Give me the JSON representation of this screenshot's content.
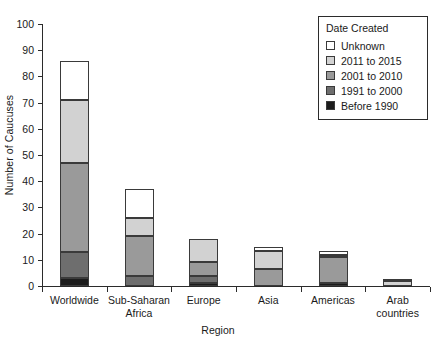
{
  "chart_data": {
    "type": "bar",
    "subtype": "stacked-bar",
    "title": "",
    "xlabel": "Region",
    "ylabel": "Number of Caucuses",
    "ylim": [
      0,
      100
    ],
    "yticks": [
      0,
      10,
      20,
      30,
      40,
      50,
      60,
      70,
      80,
      90,
      100
    ],
    "grid": false,
    "legend_position": "top-right",
    "legend_title": "Date Created",
    "categories": [
      "Worldwide",
      "Sub-Saharan\nAfrica",
      "Europe",
      "Asia",
      "Americas",
      "Arab\ncountries"
    ],
    "series": [
      {
        "name": "Before 1990",
        "color": "#1c1c1c",
        "values": [
          3,
          0,
          1,
          0,
          1,
          0
        ]
      },
      {
        "name": "1991 to 2000",
        "color": "#6e6e6e",
        "values": [
          10,
          4,
          3,
          0,
          0,
          0
        ]
      },
      {
        "name": "2001 to 2010",
        "color": "#9a9a9a",
        "values": [
          34,
          15,
          5,
          6.5,
          10,
          0
        ]
      },
      {
        "name": "2011 to 2015",
        "color": "#d2d2d2",
        "values": [
          24,
          7,
          9,
          7,
          1,
          2
        ]
      },
      {
        "name": "Unknown",
        "color": "#ffffff",
        "values": [
          15,
          11,
          0,
          1.5,
          1.5,
          0.5
        ]
      }
    ],
    "totals": [
      86,
      37,
      18,
      15,
      13.5,
      2.5
    ]
  },
  "legend": {
    "title": "Date Created",
    "items": [
      {
        "label": "Unknown",
        "color": "#ffffff"
      },
      {
        "label": "2011 to 2015",
        "color": "#d2d2d2"
      },
      {
        "label": "2001 to 2010",
        "color": "#9a9a9a"
      },
      {
        "label": "1991 to 2000",
        "color": "#6e6e6e"
      },
      {
        "label": "Before 1990",
        "color": "#1c1c1c"
      }
    ]
  },
  "axes": {
    "y_title": "Number of Caucuses",
    "x_title": "Region",
    "y_tick_labels": [
      "0",
      "10",
      "20",
      "30",
      "40",
      "50",
      "60",
      "70",
      "80",
      "90",
      "100"
    ],
    "x_tick_labels": [
      "Worldwide",
      "Sub-Saharan\nAfrica",
      "Europe",
      "Asia",
      "Americas",
      "Arab\ncountries"
    ]
  }
}
